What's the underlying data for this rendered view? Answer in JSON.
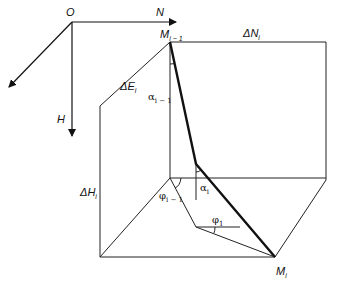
{
  "diagram": {
    "type": "wellbore-trajectory-geometry",
    "axes": {
      "origin": "O",
      "north": "N",
      "depth": "H",
      "east": ""
    },
    "points": {
      "start": {
        "label": "M",
        "subscript": "i − 1"
      },
      "end": {
        "label": "M",
        "subscript": "i"
      }
    },
    "increments": {
      "delta_north": {
        "label": "ΔN",
        "subscript": "i"
      },
      "delta_east": {
        "label": "ΔE",
        "subscript": "i"
      },
      "delta_depth": {
        "label": "ΔH",
        "subscript": "i"
      }
    },
    "angles": {
      "inclination_prev": {
        "symbol": "α",
        "subscript": "i − 1"
      },
      "inclination_curr": {
        "symbol": "α",
        "subscript": "i"
      },
      "azimuth_prev": {
        "symbol": "φ",
        "subscript": "i − 1"
      },
      "azimuth_curr": {
        "symbol": "φ",
        "subscript": "1"
      }
    },
    "colors": {
      "line": "#111111",
      "background": "#ffffff"
    }
  }
}
